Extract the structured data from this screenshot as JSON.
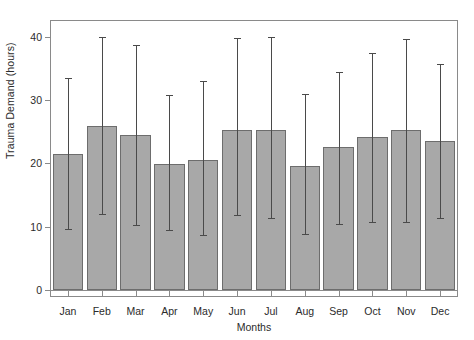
{
  "chart_data": {
    "type": "bar",
    "title": "",
    "xlabel": "Months",
    "ylabel": "Trauma Demand (hours)",
    "categories": [
      "Jan",
      "Feb",
      "Mar",
      "Apr",
      "May",
      "Jun",
      "Jul",
      "Aug",
      "Sep",
      "Oct",
      "Nov",
      "Dec"
    ],
    "values": [
      21.4,
      25.9,
      24.5,
      19.9,
      20.5,
      25.3,
      25.3,
      19.6,
      22.6,
      24.1,
      25.2,
      23.5
    ],
    "error_upper": [
      33.4,
      39.9,
      38.6,
      30.7,
      33.0,
      39.7,
      40.0,
      30.9,
      34.4,
      37.4,
      39.6,
      35.7
    ],
    "error_lower": [
      9.7,
      12.0,
      10.3,
      9.4,
      8.7,
      11.8,
      11.4,
      8.8,
      10.4,
      10.8,
      10.7,
      11.4
    ],
    "ylim": [
      0,
      41.5
    ],
    "yticks": [
      0,
      10,
      20,
      30,
      40
    ],
    "ytick_labels": [
      "0",
      "10",
      "20",
      "30",
      "40"
    ],
    "grid": false,
    "legend": "none",
    "bar_color": "#a8a8a8",
    "bar_edge_color": "#6d6d6d",
    "error_color": "#4a4a4a",
    "axis_color": "#8a8a8a",
    "text_color": "#2b2b2b"
  }
}
